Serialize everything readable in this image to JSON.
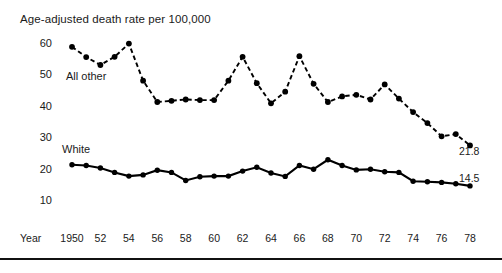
{
  "chart_data": {
    "type": "line",
    "title": "Age-adjusted death rate per 100,000",
    "xlabel": "Year",
    "ylabel": "",
    "grid": false,
    "legend": "inline-annotations",
    "xlim": [
      1950,
      1978
    ],
    "ylim": [
      5,
      63
    ],
    "yticks": [
      60,
      50,
      40,
      30,
      20,
      10
    ],
    "xticks": [
      1950,
      1952,
      1954,
      1956,
      1958,
      1960,
      1962,
      1964,
      1966,
      1968,
      1970,
      1972,
      1974,
      1976,
      1978
    ],
    "xticklabels": [
      "1950",
      "52",
      "54",
      "56",
      "58",
      "60",
      "62",
      "64",
      "66",
      "68",
      "70",
      "72",
      "74",
      "76",
      "78"
    ],
    "x": [
      1950,
      1951,
      1952,
      1953,
      1954,
      1955,
      1956,
      1957,
      1958,
      1959,
      1960,
      1961,
      1962,
      1963,
      1964,
      1965,
      1966,
      1967,
      1968,
      1969,
      1970,
      1971,
      1972,
      1973,
      1974,
      1975,
      1976,
      1977,
      1978
    ],
    "series": [
      {
        "name": "All other",
        "style": "dashed",
        "marker": "filled-circle",
        "end_label": "21.8",
        "values": [
          58.8,
          55.5,
          53.0,
          55.6,
          59.8,
          48.0,
          41.2,
          41.6,
          42.0,
          41.8,
          41.8,
          48.0,
          55.6,
          47.2,
          40.8,
          44.5,
          55.8,
          47.0,
          41.2,
          43.0,
          43.5,
          42.0,
          46.8,
          42.3,
          38.0,
          34.5,
          30.3,
          31.0,
          27.4
        ]
      },
      {
        "name": "White",
        "style": "solid",
        "marker": "filled-circle",
        "end_label": "14.5",
        "values": [
          21.2,
          21.0,
          20.2,
          18.8,
          17.6,
          18.0,
          19.5,
          18.8,
          16.2,
          17.4,
          17.6,
          17.6,
          19.2,
          20.4,
          18.6,
          17.5,
          21.0,
          19.8,
          22.8,
          21.0,
          19.6,
          19.8,
          19.0,
          18.8,
          16.0,
          15.8,
          15.6,
          15.2,
          14.5
        ]
      }
    ],
    "annotations": [
      {
        "text": "All other",
        "x": 1951.5,
        "y": 50.5
      },
      {
        "text": "White",
        "x": 1950.6,
        "y": 27.5
      },
      {
        "text": "21.8",
        "x": 1978.6,
        "y": 22.8
      },
      {
        "text": "14.5",
        "x": 1978.6,
        "y": 16.5
      }
    ],
    "colors": {
      "series": "#000000",
      "text": "#1a1a1a",
      "background": "#ffffff"
    }
  }
}
